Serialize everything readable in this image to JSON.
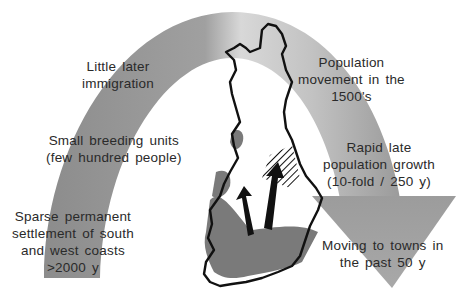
{
  "diagram": {
    "colors": {
      "arc_left": "#8a8a8a",
      "arc_right": "#c8c8c8",
      "arrow_head": "#9a9a9a",
      "map_outline": "#111111",
      "settled_region": "#7a7a7a",
      "movement_arrows": "#111111",
      "text": "#2a2a2a",
      "background": "#ffffff"
    },
    "left_labels": [
      {
        "lines": [
          "Little later",
          "immigration"
        ]
      },
      {
        "lines": [
          "Small breeding units",
          "(few hundred people)"
        ]
      },
      {
        "lines": [
          "Sparse permanent",
          "settlement of south",
          "and west coasts",
          ">2000  y"
        ]
      }
    ],
    "right_labels": [
      {
        "lines": [
          "Population",
          "movement in the",
          "1500's"
        ]
      },
      {
        "lines": [
          "Rapid late",
          "population growth",
          "(10-fold / 250 y)"
        ]
      },
      {
        "lines": [
          "Moving to towns in",
          "the past 50 y"
        ]
      }
    ],
    "map": {
      "country": "Finland",
      "legend_regions": [
        "early coastal settlement (shaded)",
        "1500's migration area (hatched)"
      ],
      "arrows": 2
    }
  }
}
